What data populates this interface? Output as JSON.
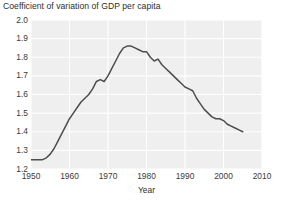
{
  "chart_data": {
    "type": "line",
    "title": "Coefficient of variation of GDP per capita",
    "subtitle": "",
    "xlabel": "Year",
    "ylabel": "",
    "xlim": [
      1950,
      2010
    ],
    "ylim": [
      1.2,
      2.0
    ],
    "grid": true,
    "legend": false,
    "legend_position": "none",
    "line_color": "#4d4d4d",
    "plot_background": "#efefef",
    "gridline_color": "#ffffff",
    "xticks": [
      1950,
      1960,
      1970,
      1980,
      1990,
      2000,
      2010
    ],
    "xtick_labels": [
      "1950",
      "1960",
      "1970",
      "1980",
      "1990",
      "2000",
      "2010"
    ],
    "yticks": [
      1.2,
      1.3,
      1.4,
      1.5,
      1.6,
      1.7,
      1.8,
      1.9,
      2.0
    ],
    "ytick_labels": [
      "1.2",
      "1.3",
      "1.4",
      "1.5",
      "1.6",
      "1.7",
      "1.8",
      "1.9",
      "2.0"
    ],
    "series": [
      {
        "name": "Coefficient of variation of GDP per capita",
        "x": [
          1950,
          1951,
          1952,
          1953,
          1954,
          1955,
          1956,
          1957,
          1958,
          1959,
          1960,
          1961,
          1962,
          1963,
          1964,
          1965,
          1966,
          1967,
          1968,
          1969,
          1970,
          1971,
          1972,
          1973,
          1974,
          1975,
          1976,
          1977,
          1978,
          1979,
          1980,
          1981,
          1982,
          1983,
          1984,
          1985,
          1986,
          1987,
          1988,
          1989,
          1990,
          1991,
          1992,
          1993,
          1994,
          1995,
          1996,
          1997,
          1998,
          1999,
          2000,
          2001,
          2002,
          2003,
          2004,
          2005
        ],
        "values": [
          1.25,
          1.25,
          1.25,
          1.25,
          1.26,
          1.28,
          1.31,
          1.35,
          1.39,
          1.43,
          1.47,
          1.5,
          1.53,
          1.56,
          1.58,
          1.6,
          1.63,
          1.67,
          1.68,
          1.67,
          1.7,
          1.74,
          1.78,
          1.82,
          1.85,
          1.86,
          1.86,
          1.85,
          1.84,
          1.83,
          1.83,
          1.8,
          1.78,
          1.79,
          1.76,
          1.74,
          1.72,
          1.7,
          1.68,
          1.66,
          1.64,
          1.63,
          1.62,
          1.58,
          1.55,
          1.52,
          1.5,
          1.48,
          1.47,
          1.47,
          1.46,
          1.44,
          1.43,
          1.42,
          1.41,
          1.4
        ]
      }
    ]
  }
}
